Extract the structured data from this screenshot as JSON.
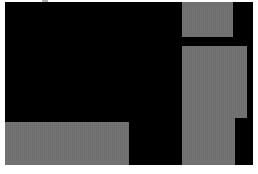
{
  "screen": {
    "background_color": "#ffffff",
    "canvas_color": "#000000",
    "panel_color": "#6e6e6e"
  },
  "panels": [
    {
      "name": "panel-top-right",
      "label": ""
    },
    {
      "name": "panel-right-upper",
      "label": ""
    },
    {
      "name": "panel-right-lower",
      "label": ""
    },
    {
      "name": "panel-bottom-left",
      "label": ""
    }
  ],
  "footer": {
    "text": ""
  }
}
